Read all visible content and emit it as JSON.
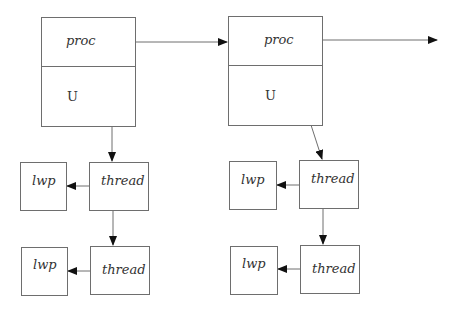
{
  "diagram": {
    "type": "process-thread-lwp structure",
    "processes": [
      {
        "proc_label": "proc",
        "u_label": "U",
        "threads": [
          {
            "thread_label": "thread",
            "lwp_label": "lwp"
          },
          {
            "thread_label": "thread",
            "lwp_label": "lwp"
          }
        ]
      },
      {
        "proc_label": "proc",
        "u_label": "U",
        "threads": [
          {
            "thread_label": "thread",
            "lwp_label": "lwp"
          },
          {
            "thread_label": "thread",
            "lwp_label": "lwp"
          }
        ]
      }
    ],
    "colors": {
      "line": "#6e6e6e",
      "arrowhead": "#111111",
      "text": "#333333"
    }
  }
}
